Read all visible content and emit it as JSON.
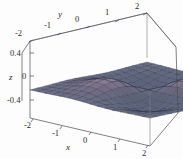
{
  "figure": {
    "kind": "surface-plot-3d",
    "background_color": "#fdfdfd",
    "frame_color": "#4a4a52"
  },
  "chart_data": {
    "type": "surface",
    "title": "",
    "xlabel": "x",
    "ylabel": "y",
    "zlabel": "z",
    "xlim": [
      -2,
      2
    ],
    "ylim": [
      -2,
      2
    ],
    "zlim": [
      -0.4,
      0.4
    ],
    "x_ticks": [
      -2,
      -1,
      0,
      1,
      2
    ],
    "y_ticks": [
      -2,
      -1,
      0,
      1,
      2
    ],
    "z_ticks": [
      -0.4,
      0,
      0.4
    ],
    "x_tick_labels": [
      "-2",
      "-1",
      "0",
      "1",
      "2"
    ],
    "y_tick_labels": [
      "-2",
      "-1",
      "0",
      "1",
      "2"
    ],
    "z_tick_labels": [
      "-0.4",
      "0",
      "0.4"
    ],
    "grid": true,
    "legend": "none",
    "mesh_lines": true,
    "surface_colors": {
      "low": "#4e5870",
      "mid": "#6e6880",
      "high": "#b79aa4",
      "highlight": "#d9c6c9",
      "flat_plain": "#5b6379",
      "mesh_line": "#2f3240"
    },
    "function": "z = x y e^(-x^2 - y^2)",
    "peak_value": 0.4,
    "trough_value": -0.4,
    "samples": 16
  },
  "axes": {
    "x": {
      "title": "x",
      "ticks": [
        {
          "label": "-2"
        },
        {
          "label": "-1"
        },
        {
          "label": "0"
        },
        {
          "label": "1"
        },
        {
          "label": "2"
        }
      ]
    },
    "y": {
      "title": "y",
      "ticks": [
        {
          "label": "-2"
        },
        {
          "label": "-1"
        },
        {
          "label": "0"
        },
        {
          "label": "1"
        },
        {
          "label": "2"
        }
      ]
    },
    "z": {
      "title": "z",
      "ticks": [
        {
          "label": "0.4"
        },
        {
          "label": "0"
        },
        {
          "label": "-0.4"
        }
      ]
    }
  }
}
